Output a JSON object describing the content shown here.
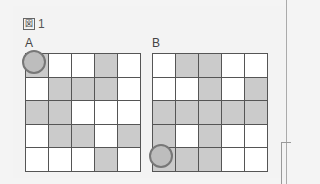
{
  "figure": {
    "title": "図 1",
    "title_mark": "図",
    "title_number": "1"
  },
  "grids": [
    {
      "label": "A",
      "circle_cell": [
        0,
        0
      ],
      "cells": [
        [
          "g",
          "w",
          "w",
          "g",
          "w"
        ],
        [
          "w",
          "g",
          "g",
          "g",
          "w"
        ],
        [
          "g",
          "g",
          "w",
          "w",
          "w"
        ],
        [
          "w",
          "g",
          "g",
          "w",
          "g"
        ],
        [
          "w",
          "w",
          "w",
          "g",
          "w"
        ]
      ]
    },
    {
      "label": "B",
      "circle_cell": [
        4,
        0
      ],
      "cells": [
        [
          "w",
          "g",
          "g",
          "w",
          "w"
        ],
        [
          "w",
          "w",
          "g",
          "w",
          "g"
        ],
        [
          "g",
          "g",
          "g",
          "g",
          "g"
        ],
        [
          "g",
          "w",
          "g",
          "w",
          "w"
        ],
        [
          "g",
          "g",
          "g",
          "w",
          "w"
        ]
      ]
    }
  ],
  "colors": {
    "grey_cell": "#cbcbcb",
    "white_cell": "#ffffff",
    "grid_line": "#555555",
    "circle": "#777777"
  }
}
